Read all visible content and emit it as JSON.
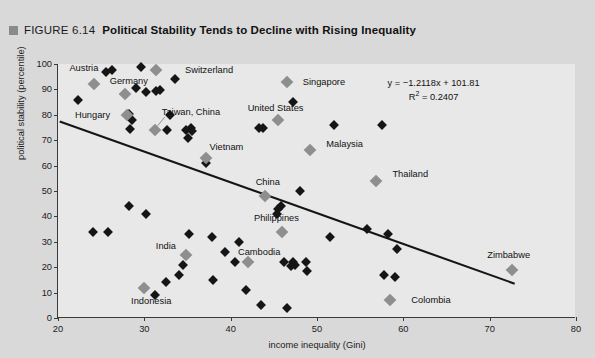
{
  "figure": {
    "bullet_icon": "gray-square-bullet",
    "number": "FIGURE 6.14",
    "title": "Political Stability Tends to Decline with Rising Inequality"
  },
  "chart_data": {
    "type": "scatter",
    "title": "Political Stability Tends to Decline with Rising Inequality",
    "xlabel": "income inequality (Gini)",
    "ylabel": "political stability (percentile)",
    "xlim": [
      20,
      80
    ],
    "ylim": [
      0,
      100
    ],
    "xticks": [
      20,
      30,
      40,
      50,
      60,
      70,
      80
    ],
    "yticks": [
      0,
      10,
      20,
      30,
      40,
      50,
      60,
      70,
      80,
      90,
      100
    ],
    "grid": false,
    "legend": "none",
    "annotations": {
      "equation": "y = −1.2118x + 101.81",
      "r_squared_label": "R",
      "r_squared_sup": "2",
      "r_squared_value": " = 0.2407"
    },
    "trendline": {
      "slope": -1.2118,
      "intercept": 101.81,
      "x_start": 20.2,
      "x_end": 73.0,
      "color": "#151515"
    },
    "marker_colors": {
      "default": "#151515",
      "highlighted": "#8e8e8e"
    },
    "labeled_points": [
      {
        "label": "Austria",
        "x": 24.2,
        "y": 92,
        "lx": 23.0,
        "ly": 98.5,
        "anchor": "center"
      },
      {
        "label": "Switzerland",
        "x": 31.4,
        "y": 97.5,
        "lx": 37.5,
        "ly": 97.8,
        "anchor": "center"
      },
      {
        "label": "Germany",
        "x": 27.8,
        "y": 88,
        "lx": 28.2,
        "ly": 93.5,
        "anchor": "center"
      },
      {
        "label": "Hungary",
        "x": 28.0,
        "y": 80,
        "lx": 24.0,
        "ly": 80.0,
        "anchor": "center"
      },
      {
        "label": "Taiwan, China",
        "x": 31.2,
        "y": 74,
        "lx": 35.4,
        "ly": 81.0,
        "anchor": "center"
      },
      {
        "label": "Vietnam",
        "x": 37.2,
        "y": 63,
        "lx": 39.5,
        "ly": 67.5,
        "anchor": "center"
      },
      {
        "label": "Singapore",
        "x": 46.5,
        "y": 93,
        "lx": 50.8,
        "ly": 93.0,
        "anchor": "center"
      },
      {
        "label": "United States",
        "x": 45.5,
        "y": 78,
        "lx": 45.2,
        "ly": 82.5,
        "anchor": "center"
      },
      {
        "label": "Malaysia",
        "x": 49.2,
        "y": 66,
        "lx": 53.2,
        "ly": 68.5,
        "anchor": "center"
      },
      {
        "label": "Thailand",
        "x": 56.8,
        "y": 54,
        "lx": 60.8,
        "ly": 56.5,
        "anchor": "center"
      },
      {
        "label": "China",
        "x": 44.0,
        "y": 48,
        "lx": 44.3,
        "ly": 53.5,
        "anchor": "center"
      },
      {
        "label": "Philippines",
        "x": 46.0,
        "y": 34,
        "lx": 45.3,
        "ly": 39.5,
        "anchor": "center"
      },
      {
        "label": "India",
        "x": 34.8,
        "y": 25,
        "lx": 32.5,
        "ly": 28.5,
        "anchor": "center"
      },
      {
        "label": "Cambodia",
        "x": 42.0,
        "y": 22,
        "lx": 43.3,
        "ly": 26.0,
        "anchor": "center"
      },
      {
        "label": "Indonesia",
        "x": 30.0,
        "y": 12,
        "lx": 30.8,
        "ly": 6.5,
        "anchor": "center"
      },
      {
        "label": "Colombia",
        "x": 58.5,
        "y": 7,
        "lx": 63.2,
        "ly": 7.0,
        "anchor": "center"
      },
      {
        "label": "Zimbabwe",
        "x": 72.6,
        "y": 19,
        "lx": 72.2,
        "ly": 25.0,
        "anchor": "center"
      }
    ],
    "unlabeled_points": [
      {
        "x": 22.3,
        "y": 86
      },
      {
        "x": 25.6,
        "y": 97
      },
      {
        "x": 26.3,
        "y": 97.5
      },
      {
        "x": 29.6,
        "y": 99
      },
      {
        "x": 33.5,
        "y": 94
      },
      {
        "x": 29.0,
        "y": 90.5
      },
      {
        "x": 30.2,
        "y": 89
      },
      {
        "x": 31.3,
        "y": 89.5
      },
      {
        "x": 31.8,
        "y": 89.8
      },
      {
        "x": 28.2,
        "y": 80.5
      },
      {
        "x": 28.6,
        "y": 78
      },
      {
        "x": 28.3,
        "y": 74.5
      },
      {
        "x": 33.0,
        "y": 80
      },
      {
        "x": 32.6,
        "y": 74
      },
      {
        "x": 34.8,
        "y": 74
      },
      {
        "x": 35.0,
        "y": 71
      },
      {
        "x": 35.4,
        "y": 75
      },
      {
        "x": 35.5,
        "y": 73.5
      },
      {
        "x": 37.1,
        "y": 61
      },
      {
        "x": 43.3,
        "y": 75
      },
      {
        "x": 43.8,
        "y": 75
      },
      {
        "x": 47.2,
        "y": 85
      },
      {
        "x": 52.0,
        "y": 76
      },
      {
        "x": 57.5,
        "y": 76
      },
      {
        "x": 28.2,
        "y": 44
      },
      {
        "x": 30.2,
        "y": 41
      },
      {
        "x": 24.0,
        "y": 34
      },
      {
        "x": 25.8,
        "y": 34
      },
      {
        "x": 35.2,
        "y": 33
      },
      {
        "x": 37.8,
        "y": 32
      },
      {
        "x": 41.0,
        "y": 30
      },
      {
        "x": 39.4,
        "y": 26
      },
      {
        "x": 45.5,
        "y": 43
      },
      {
        "x": 45.8,
        "y": 44
      },
      {
        "x": 45.4,
        "y": 41
      },
      {
        "x": 48.0,
        "y": 50
      },
      {
        "x": 51.5,
        "y": 32
      },
      {
        "x": 55.8,
        "y": 35
      },
      {
        "x": 58.2,
        "y": 33
      },
      {
        "x": 34.5,
        "y": 21
      },
      {
        "x": 34.0,
        "y": 17
      },
      {
        "x": 38.0,
        "y": 15
      },
      {
        "x": 40.5,
        "y": 22
      },
      {
        "x": 46.2,
        "y": 22
      },
      {
        "x": 47.2,
        "y": 22
      },
      {
        "x": 47.4,
        "y": 21
      },
      {
        "x": 47.0,
        "y": 20.5
      },
      {
        "x": 48.7,
        "y": 22
      },
      {
        "x": 48.8,
        "y": 18.5
      },
      {
        "x": 41.8,
        "y": 11
      },
      {
        "x": 43.5,
        "y": 5
      },
      {
        "x": 46.5,
        "y": 4
      },
      {
        "x": 31.2,
        "y": 9
      },
      {
        "x": 32.5,
        "y": 14
      },
      {
        "x": 57.8,
        "y": 17
      },
      {
        "x": 59.0,
        "y": 16
      },
      {
        "x": 59.3,
        "y": 27
      }
    ]
  }
}
